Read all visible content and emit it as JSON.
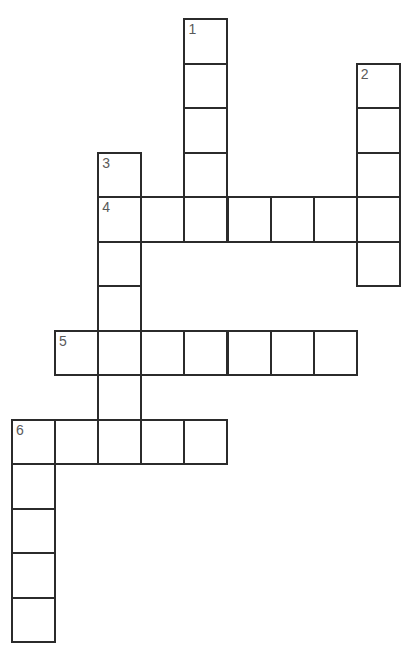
{
  "puzzle": {
    "type": "crossword",
    "grid": {
      "origin_x": 12,
      "origin_y": 19,
      "col_pitch": 43.1,
      "row_pitch": 44.5,
      "border_color": "#2b2b2b",
      "label_color": "#5a5a5a",
      "background": "#ffffff"
    },
    "entries": [
      {
        "number": "1",
        "direction": "down",
        "row": 0,
        "col": 4,
        "length": 5
      },
      {
        "number": "2",
        "direction": "down",
        "row": 1,
        "col": 8,
        "length": 5
      },
      {
        "number": "3",
        "direction": "down",
        "row": 3,
        "col": 2,
        "length": 7
      },
      {
        "number": "4",
        "direction": "across",
        "row": 4,
        "col": 2,
        "length": 7
      },
      {
        "number": "5",
        "direction": "across",
        "row": 7,
        "col": 1,
        "length": 7
      },
      {
        "number": "6",
        "direction": "across",
        "row": 9,
        "col": 0,
        "length": 5
      },
      {
        "number": "6",
        "direction": "down",
        "row": 9,
        "col": 0,
        "length": 5
      }
    ],
    "cells": [
      {
        "row": 0,
        "col": 4,
        "label": "1",
        "value": ""
      },
      {
        "row": 1,
        "col": 4,
        "label": "",
        "value": ""
      },
      {
        "row": 2,
        "col": 4,
        "label": "",
        "value": ""
      },
      {
        "row": 3,
        "col": 4,
        "label": "",
        "value": ""
      },
      {
        "row": 1,
        "col": 8,
        "label": "2",
        "value": ""
      },
      {
        "row": 2,
        "col": 8,
        "label": "",
        "value": ""
      },
      {
        "row": 3,
        "col": 8,
        "label": "",
        "value": ""
      },
      {
        "row": 5,
        "col": 8,
        "label": "",
        "value": ""
      },
      {
        "row": 3,
        "col": 2,
        "label": "3",
        "value": ""
      },
      {
        "row": 4,
        "col": 2,
        "label": "4",
        "value": ""
      },
      {
        "row": 4,
        "col": 3,
        "label": "",
        "value": ""
      },
      {
        "row": 4,
        "col": 4,
        "label": "",
        "value": ""
      },
      {
        "row": 4,
        "col": 5,
        "label": "",
        "value": ""
      },
      {
        "row": 4,
        "col": 6,
        "label": "",
        "value": ""
      },
      {
        "row": 4,
        "col": 7,
        "label": "",
        "value": ""
      },
      {
        "row": 4,
        "col": 8,
        "label": "",
        "value": ""
      },
      {
        "row": 5,
        "col": 2,
        "label": "",
        "value": ""
      },
      {
        "row": 6,
        "col": 2,
        "label": "",
        "value": ""
      },
      {
        "row": 7,
        "col": 1,
        "label": "5",
        "value": ""
      },
      {
        "row": 7,
        "col": 2,
        "label": "",
        "value": ""
      },
      {
        "row": 7,
        "col": 3,
        "label": "",
        "value": ""
      },
      {
        "row": 7,
        "col": 4,
        "label": "",
        "value": ""
      },
      {
        "row": 7,
        "col": 5,
        "label": "",
        "value": ""
      },
      {
        "row": 7,
        "col": 6,
        "label": "",
        "value": ""
      },
      {
        "row": 7,
        "col": 7,
        "label": "",
        "value": ""
      },
      {
        "row": 8,
        "col": 2,
        "label": "",
        "value": ""
      },
      {
        "row": 9,
        "col": 0,
        "label": "6",
        "value": ""
      },
      {
        "row": 9,
        "col": 1,
        "label": "",
        "value": ""
      },
      {
        "row": 9,
        "col": 2,
        "label": "",
        "value": ""
      },
      {
        "row": 9,
        "col": 3,
        "label": "",
        "value": ""
      },
      {
        "row": 9,
        "col": 4,
        "label": "",
        "value": ""
      },
      {
        "row": 10,
        "col": 0,
        "label": "",
        "value": ""
      },
      {
        "row": 11,
        "col": 0,
        "label": "",
        "value": ""
      },
      {
        "row": 12,
        "col": 0,
        "label": "",
        "value": ""
      },
      {
        "row": 13,
        "col": 0,
        "label": "",
        "value": ""
      }
    ]
  }
}
